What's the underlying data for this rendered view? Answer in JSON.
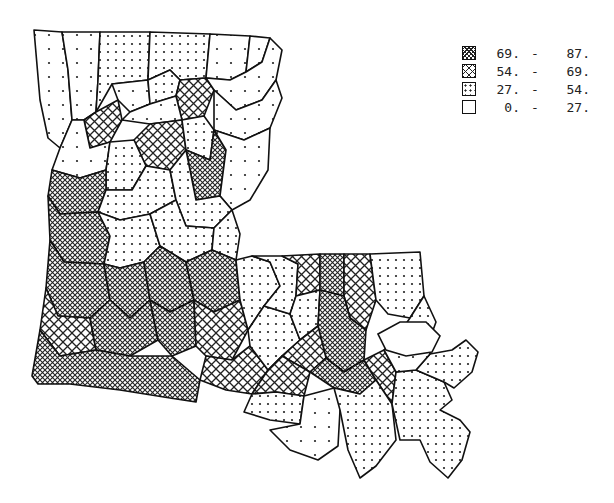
{
  "map": {
    "region": "Louisiana",
    "unit": "parish",
    "legend": [
      {
        "class": "c4",
        "low": "69.",
        "high": "87.",
        "pattern": "dense-crosshatch"
      },
      {
        "class": "c3",
        "low": "54.",
        "high": "69.",
        "pattern": "crosshatch"
      },
      {
        "class": "c2",
        "low": "27.",
        "high": "54.",
        "pattern": "dense-dots"
      },
      {
        "class": "c1",
        "low": "0.",
        "high": "27.",
        "pattern": "sparse-dots"
      }
    ],
    "dash": "-",
    "parishes": [
      {
        "id": "p01",
        "cls": "c1",
        "pts": "34,30 62,32 68,70 72,120 60,148 48,138 40,100"
      },
      {
        "id": "p02",
        "cls": "c1",
        "pts": "62,32 100,32 98,80 96,112 84,120 72,120 68,70"
      },
      {
        "id": "p03",
        "cls": "c2",
        "pts": "100,32 150,32 148,80 112,84 96,112 98,80"
      },
      {
        "id": "p04",
        "cls": "c2",
        "pts": "150,32 210,34 206,78 180,80 170,70 148,80"
      },
      {
        "id": "p05",
        "cls": "c1",
        "pts": "210,34 250,36 246,72 230,80 206,78"
      },
      {
        "id": "p06",
        "cls": "c1",
        "pts": "250,36 270,38 262,62 246,72"
      },
      {
        "id": "p07",
        "cls": "c1",
        "pts": "112,84 148,80 150,104 130,112 118,100"
      },
      {
        "id": "p08",
        "cls": "c2",
        "pts": "148,80 170,70 180,80 176,96 150,104"
      },
      {
        "id": "p09",
        "cls": "c3",
        "pts": "180,80 206,78 214,90 204,116 182,120 176,96"
      },
      {
        "id": "p10",
        "cls": "c1",
        "pts": "206,78 230,80 246,72 262,62 270,38 282,50 276,80 262,100 236,110 214,90"
      },
      {
        "id": "p11",
        "cls": "c3",
        "pts": "84,120 96,112 118,100 122,120 110,142 90,148"
      },
      {
        "id": "p12",
        "cls": "c1",
        "pts": "122,120 130,112 150,104 176,96 182,120 150,124"
      },
      {
        "id": "p13",
        "cls": "c3",
        "pts": "150,124 182,120 186,150 170,170 146,166 134,140"
      },
      {
        "id": "p14",
        "cls": "c2",
        "pts": "182,120 204,116 214,130 210,160 186,150"
      },
      {
        "id": "p15",
        "cls": "c1",
        "pts": "214,90 236,110 262,100 276,80 282,98 270,128 244,140 214,130"
      },
      {
        "id": "p16",
        "cls": "c1",
        "pts": "60,148 72,120 84,120 90,148 110,142 106,170 80,178 52,170"
      },
      {
        "id": "p17",
        "cls": "c2",
        "pts": "110,142 134,140 146,166 132,190 106,190 106,170"
      },
      {
        "id": "p18",
        "cls": "c4",
        "pts": "186,150 210,160 214,130 226,150 220,196 196,200"
      },
      {
        "id": "p19",
        "cls": "c1",
        "pts": "214,130 244,140 270,128 268,170 250,200 232,210 220,196 226,150"
      },
      {
        "id": "p20",
        "cls": "c4",
        "pts": "52,170 80,178 106,170 106,190 98,212 60,214 48,196"
      },
      {
        "id": "p21",
        "cls": "c2",
        "pts": "106,190 132,190 146,166 170,170 176,200 150,214 120,220 98,212"
      },
      {
        "id": "p22",
        "cls": "c2",
        "pts": "170,170 186,150 196,200 220,196 232,210 214,228 186,226 176,200"
      },
      {
        "id": "p23",
        "cls": "c4",
        "pts": "48,196 60,214 98,212 110,236 104,264 64,262 50,240"
      },
      {
        "id": "p24",
        "cls": "c2",
        "pts": "98,212 120,220 150,214 160,246 144,262 120,268 104,264 110,236"
      },
      {
        "id": "p25",
        "cls": "c2",
        "pts": "150,214 176,200 186,226 214,228 212,250 186,262 160,246"
      },
      {
        "id": "p26",
        "cls": "c2",
        "pts": "214,228 232,210 240,234 236,260 212,250"
      },
      {
        "id": "p27",
        "cls": "c4",
        "pts": "50,240 64,262 104,264 110,300 90,318 58,316 46,288"
      },
      {
        "id": "p28",
        "cls": "c4",
        "pts": "104,264 120,268 144,262 150,300 130,318 110,300"
      },
      {
        "id": "p29",
        "cls": "c4",
        "pts": "144,262 160,246 186,262 194,300 170,312 150,300"
      },
      {
        "id": "p30",
        "cls": "c4",
        "pts": "186,262 212,250 236,260 240,300 214,312 194,300"
      },
      {
        "id": "p31",
        "cls": "c3",
        "pts": "46,288 58,316 90,318 96,350 60,356 40,330"
      },
      {
        "id": "p32",
        "cls": "c4",
        "pts": "90,318 110,300 130,318 150,300 158,340 130,356 96,350"
      },
      {
        "id": "p33",
        "cls": "c4",
        "pts": "150,300 170,312 194,300 196,346 172,356 158,340"
      },
      {
        "id": "p34",
        "cls": "c3",
        "pts": "194,300 214,312 240,300 248,330 232,360 206,356 196,346"
      },
      {
        "id": "p35",
        "cls": "c4",
        "pts": "40,330 60,356 96,350 130,356 172,356 200,380 196,402 170,398 120,390 70,384 38,384 32,376"
      },
      {
        "id": "p36",
        "cls": "c3",
        "pts": "206,356 232,360 250,346 268,370 252,394 226,390 200,380"
      },
      {
        "id": "p37",
        "cls": "c2",
        "pts": "236,260 252,256 270,262 280,286 264,306 248,330 240,300"
      },
      {
        "id": "p38",
        "cls": "c2",
        "pts": "248,330 264,306 290,314 300,340 282,356 268,370 250,346"
      },
      {
        "id": "p39",
        "cls": "c2",
        "pts": "252,256 282,256 298,264 296,296 290,314 264,306 280,286 270,262"
      },
      {
        "id": "p40",
        "cls": "c3",
        "pts": "282,256 320,254 320,290 296,296 298,264"
      },
      {
        "id": "p41",
        "cls": "c4",
        "pts": "320,254 344,254 344,296 320,290"
      },
      {
        "id": "p42",
        "cls": "c3",
        "pts": "344,254 370,254 376,300 366,330 350,318 344,296"
      },
      {
        "id": "p43",
        "cls": "c2",
        "pts": "370,254 420,252 424,296 410,318 388,314 376,300"
      },
      {
        "id": "p44",
        "cls": "c2",
        "pts": "296,296 320,290 318,326 300,340 290,314"
      },
      {
        "id": "p45",
        "cls": "c4",
        "pts": "320,290 344,296 350,318 366,330 364,360 344,372 326,358 318,326"
      },
      {
        "id": "p46",
        "cls": "c3",
        "pts": "300,340 318,326 326,358 310,372 282,356"
      },
      {
        "id": "p47",
        "cls": "c3",
        "pts": "268,370 282,356 310,372 304,396 276,392 252,394"
      },
      {
        "id": "p48",
        "cls": "c4",
        "pts": "326,358 344,372 364,360 376,380 360,394 334,388 310,372"
      },
      {
        "id": "p49",
        "cls": "c3",
        "pts": "364,360 384,350 396,372 392,404 376,380"
      },
      {
        "id": "p50",
        "cls": "c2",
        "pts": "410,318 424,296 436,322 428,344 412,346 396,338"
      },
      {
        "id": "p51",
        "cls": "c2",
        "pts": "252,394 276,392 304,396 300,424 270,420 244,412"
      },
      {
        "id": "p52",
        "cls": "c1",
        "pts": "304,396 334,388 360,394 340,410 338,446 318,460 290,450 270,430 300,424"
      },
      {
        "id": "p53",
        "cls": "c2",
        "pts": "334,388 360,394 376,380 392,404 396,440 376,466 360,478 348,450 340,410"
      },
      {
        "id": "p54",
        "cls": "c2",
        "pts": "392,404 396,372 416,370 444,382 452,400 440,410 460,420 470,432 462,460 448,478 430,462 420,440 400,440"
      },
      {
        "id": "p55",
        "cls": "c2",
        "pts": "416,370 430,354 452,350 466,340 478,352 472,372 454,388 444,382"
      },
      {
        "id": "p56",
        "cls": "c1",
        "pts": "384,350 396,338 412,346 428,344 430,354 416,370 396,372"
      }
    ],
    "lake": "378,334 400,322 426,322 440,336 432,352 406,356 386,350"
  }
}
